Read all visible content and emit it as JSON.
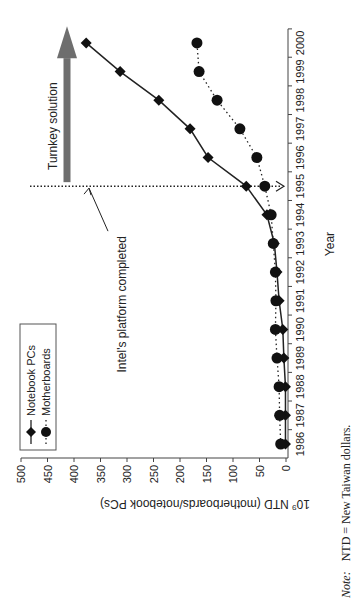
{
  "chart_data": {
    "type": "line",
    "title": "",
    "xlabel": "Year",
    "ylabel": "10⁹ NTD (motherboards/notebook PCs)",
    "ylabel_prefix": "10",
    "ylabel_exp": "9",
    "ylabel_rest": " NTD (motherboards/notebook PCs)",
    "ylim": [
      0,
      500
    ],
    "y_ticks": [
      "0",
      "50",
      "100",
      "150",
      "200",
      "250",
      "300",
      "350",
      "400",
      "450",
      "500"
    ],
    "x": [
      "1986",
      "1987",
      "1988",
      "1989",
      "1990",
      "1991",
      "1992",
      "1993",
      "1994",
      "1995",
      "1996",
      "1997",
      "1998",
      "1999",
      "2000"
    ],
    "series": [
      {
        "name": "Notebook PCs",
        "marker": "diamond",
        "line": "solid",
        "values": [
          1,
          1,
          1,
          4,
          6,
          13,
          17,
          22,
          36,
          75,
          147,
          181,
          240,
          313,
          377
        ]
      },
      {
        "name": "Motherboards",
        "marker": "circle",
        "line": "dotted",
        "values": [
          10,
          12,
          13,
          17,
          20,
          19,
          20,
          24,
          28,
          40,
          55,
          87,
          130,
          164,
          168
        ]
      }
    ],
    "legend_position": "upper-left",
    "grid": false,
    "annotations": [
      {
        "text": "Intel's platform completed",
        "at_x": "1995",
        "type": "vertical-dotted-line-with-arrow"
      },
      {
        "text": "Turnkey solution",
        "from_x": "1995",
        "type": "right-pointing-block-arrow"
      }
    ]
  },
  "legend": {
    "items": [
      {
        "label": "Notebook PCs"
      },
      {
        "label": "Motherboards"
      }
    ]
  },
  "annotations": {
    "intel": "Intel's platform completed",
    "turnkey": "Turnkey solution"
  },
  "note": {
    "label": "Note:",
    "text": "NTD = New Taiwan dollars."
  },
  "colors": {
    "line": "#222222",
    "arrow": "#6e6e6e"
  }
}
